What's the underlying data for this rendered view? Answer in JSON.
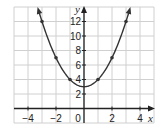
{
  "chart_data": {
    "type": "line",
    "title": "",
    "function": "y = x^2 + 3",
    "xlabel": "x",
    "ylabel": "y",
    "xlim": [
      -5,
      5
    ],
    "ylim": [
      -2,
      14
    ],
    "grid": true,
    "x_ticks": [
      -4,
      -2,
      0,
      2,
      4
    ],
    "x_tick_labels": [
      "−4",
      "−2",
      "0",
      "2",
      "4"
    ],
    "y_ticks": [
      2,
      4,
      6,
      8,
      10,
      12
    ],
    "y_tick_labels": [
      "2",
      "4",
      "6",
      "8",
      "10",
      "12"
    ],
    "series": [
      {
        "name": "parabola",
        "points": [
          [
            -3,
            12
          ],
          [
            -2,
            7
          ],
          [
            -1,
            4
          ],
          [
            1,
            4
          ],
          [
            2,
            7
          ],
          [
            3,
            12
          ]
        ],
        "vertex": [
          0,
          3
        ],
        "arrows_at_ends": true
      }
    ],
    "colors": {
      "curve": "#333333",
      "grid": "#d0d0d0",
      "axis": "#222222"
    }
  }
}
